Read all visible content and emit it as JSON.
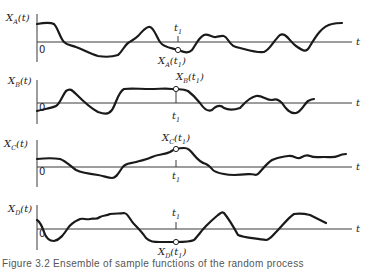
{
  "figure": {
    "time_axis_label": "t",
    "origin_label": "0",
    "time_instant_label": "t",
    "time_instant_subscript": "1",
    "caption": "Figure 3.2   Ensemble of sample functions of the random process"
  },
  "panels": [
    {
      "id": "A",
      "y_label": "X",
      "y_sub": "A",
      "y_arg": "(t)",
      "sample_label": "X",
      "sample_sub": "A",
      "sample_arg": "(t",
      "sample_arg_sub": "1",
      "sample_arg_close": ")"
    },
    {
      "id": "B",
      "y_label": "X",
      "y_sub": "B",
      "y_arg": "(t)",
      "sample_label": "X",
      "sample_sub": "B",
      "sample_arg": "(t",
      "sample_arg_sub": "1",
      "sample_arg_close": ")"
    },
    {
      "id": "C",
      "y_label": "X",
      "y_sub": "C",
      "y_arg": "(t)",
      "sample_label": "X",
      "sample_sub": "C",
      "sample_arg": "(t",
      "sample_arg_sub": "1",
      "sample_arg_close": ")"
    },
    {
      "id": "D",
      "y_label": "X",
      "y_sub": "D",
      "y_arg": "(t)",
      "sample_label": "X",
      "sample_sub": "D",
      "sample_arg": "(t",
      "sample_arg_sub": "1",
      "sample_arg_close": ")"
    }
  ],
  "colors": {
    "ink": "#1a1a1a",
    "axis": "#3a3a3a",
    "background": "#ffffff"
  }
}
